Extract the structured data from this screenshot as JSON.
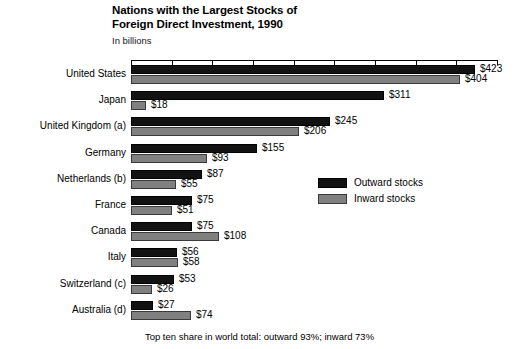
{
  "header": {
    "title_line1": "Nations with the Largest Stocks of",
    "title_line2": "Foreign Direct Investment, 1990",
    "subtitle": "In billions"
  },
  "footnote": "Top ten share in world total: outward 93%; inward 73%",
  "legend": {
    "position": "middle-right",
    "items": [
      {
        "label": "Outward stocks",
        "color": "#121212"
      },
      {
        "label": "Inward stocks",
        "color": "#808080"
      }
    ]
  },
  "value_labels": [
    "$423",
    "$404",
    "$311",
    "$18",
    "$245",
    "$206",
    "$155",
    "$93",
    "$87",
    "$55",
    "$75",
    "$51",
    "$75",
    "$108",
    "$56",
    "$58",
    "$53",
    "$26",
    "$27",
    "$74"
  ],
  "chart_data": {
    "type": "bar",
    "orientation": "horizontal",
    "title": "Nations with the Largest Stocks of Foreign Direct Investment, 1990",
    "subtitle": "In billions",
    "xlabel": "",
    "ylabel": "",
    "units": "billions of US dollars",
    "xlim": [
      0,
      450
    ],
    "xticks": [
      0,
      50,
      100,
      150,
      200,
      250,
      300,
      350,
      400,
      450
    ],
    "grid": false,
    "axis_position": "top",
    "legend_position": "middle-right",
    "categories": [
      "United States",
      "Japan",
      "United Kingdom (a)",
      "Germany",
      "Netherlands (b)",
      "France",
      "Canada",
      "Italy",
      "Switzerland (c)",
      "Australia (d)"
    ],
    "series": [
      {
        "name": "Outward stocks",
        "color": "#121212",
        "values": [
          423,
          311,
          245,
          155,
          87,
          75,
          75,
          56,
          53,
          27
        ]
      },
      {
        "name": "Inward stocks",
        "color": "#808080",
        "values": [
          404,
          18,
          206,
          93,
          55,
          51,
          108,
          58,
          26,
          74
        ]
      }
    ],
    "annotations": [
      "Top ten share in world total: outward 93%; inward 73%"
    ]
  }
}
